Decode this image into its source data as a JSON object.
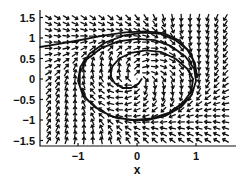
{
  "chart_data": {
    "type": "quiver",
    "title": "",
    "xlabel": "x",
    "ylabel": "",
    "xlim": [
      -1.64,
      1.66
    ],
    "ylim": [
      -1.63,
      1.68
    ],
    "xticks": [
      -1,
      0,
      1
    ],
    "xtick_labels": [
      "−1",
      "0",
      "1"
    ],
    "yticks": [
      1.5,
      1,
      0.5,
      0,
      -0.5,
      -1,
      -1.5
    ],
    "ytick_labels": [
      "1.5",
      "1",
      "0.5",
      "0",
      "−0.5",
      "−1",
      "−1.5"
    ],
    "grid": false,
    "legend": null,
    "vector_field": {
      "description": "Direction field on a uniform grid with unit-length arrows",
      "x_range": [
        -1.5,
        1.5
      ],
      "y_range": [
        -1.5,
        1.5
      ],
      "n": 21,
      "equations": {
        "dx": "y + x*(1 - x^2 - y^2)",
        "dy": "-x + y*(1 - x^2 - y^2)"
      }
    },
    "trajectory": {
      "description": "Solution curve spiraling clockwise outward from near origin toward a closed orbit of radius ~1, then exiting to the left edge near y=0.8",
      "points": [
        [
          0.08,
          0.0
        ],
        [
          0.02,
          -0.12
        ],
        [
          -0.1,
          -0.22
        ],
        [
          -0.25,
          -0.22
        ],
        [
          -0.38,
          -0.1
        ],
        [
          -0.45,
          0.08
        ],
        [
          -0.42,
          0.3
        ],
        [
          -0.3,
          0.5
        ],
        [
          -0.1,
          0.64
        ],
        [
          0.15,
          0.7
        ],
        [
          0.4,
          0.66
        ],
        [
          0.65,
          0.5
        ],
        [
          0.85,
          0.25
        ],
        [
          0.95,
          0.0
        ],
        [
          0.92,
          -0.3
        ],
        [
          0.78,
          -0.58
        ],
        [
          0.55,
          -0.82
        ],
        [
          0.25,
          -0.96
        ],
        [
          -0.05,
          -1.0
        ],
        [
          -0.35,
          -0.95
        ],
        [
          -0.62,
          -0.78
        ],
        [
          -0.85,
          -0.5
        ],
        [
          -0.97,
          -0.18
        ],
        [
          -0.97,
          0.15
        ],
        [
          -0.85,
          0.48
        ],
        [
          -0.62,
          0.74
        ],
        [
          -0.32,
          0.92
        ],
        [
          0.0,
          0.98
        ],
        [
          0.3,
          0.95
        ],
        [
          0.58,
          0.8
        ],
        [
          0.82,
          0.55
        ],
        [
          0.97,
          0.25
        ],
        [
          1.0,
          -0.05
        ],
        [
          0.93,
          -0.38
        ],
        [
          0.75,
          -0.68
        ],
        [
          0.48,
          -0.9
        ],
        [
          0.18,
          -1.0
        ],
        [
          -0.12,
          -1.0
        ],
        [
          -0.45,
          -0.9
        ],
        [
          -0.72,
          -0.68
        ],
        [
          -0.92,
          -0.38
        ],
        [
          -1.0,
          -0.05
        ],
        [
          -0.96,
          0.3
        ],
        [
          -0.8,
          0.62
        ],
        [
          -0.55,
          0.88
        ],
        [
          -0.22,
          1.06
        ],
        [
          0.1,
          1.13
        ],
        [
          0.4,
          1.1
        ],
        [
          0.65,
          0.95
        ],
        [
          0.85,
          0.72
        ],
        [
          0.98,
          0.4
        ],
        [
          1.02,
          0.05
        ]
      ],
      "tail": [
        [
          0.45,
          1.12
        ],
        [
          0.15,
          1.16
        ],
        [
          -0.2,
          1.14
        ],
        [
          -0.6,
          1.05
        ],
        [
          -1.0,
          0.94
        ],
        [
          -1.35,
          0.85
        ],
        [
          -1.64,
          0.78
        ]
      ]
    }
  }
}
